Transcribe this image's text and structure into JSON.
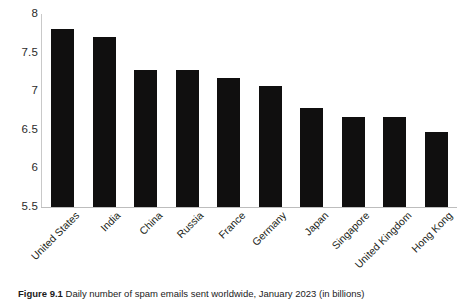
{
  "caption": {
    "label": "Figure 9.1",
    "text": "Daily number of spam emails sent worldwide, January 2023 (in billions)"
  },
  "colors": {
    "bar": "#100f0f",
    "axis": "#bdbdbd",
    "text": "#231f20",
    "background": "#ffffff"
  },
  "chart_data": {
    "type": "bar",
    "title": "Daily number of spam emails sent worldwide, January 2023 (in billions)",
    "xlabel": "",
    "ylabel": "",
    "ylim": [
      5.5,
      8
    ],
    "yticks": [
      "5.5",
      "6",
      "6.5",
      "7",
      "7.5",
      "8"
    ],
    "ytick_values": [
      5.5,
      6,
      6.5,
      7,
      7.5,
      8
    ],
    "grid": false,
    "legend": false,
    "categories": [
      "United States",
      "India",
      "China",
      "Russia",
      "France",
      "Germany",
      "Japan",
      "Singapore",
      "United Kingdom",
      "Hong Kong"
    ],
    "values": [
      7.8,
      7.7,
      7.28,
      7.28,
      7.17,
      7.07,
      6.78,
      6.67,
      6.67,
      6.47
    ]
  }
}
